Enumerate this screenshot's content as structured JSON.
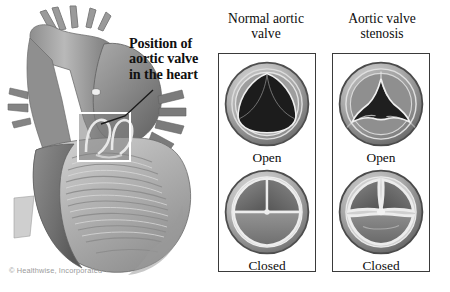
{
  "figure": {
    "background_color": "#ffffff",
    "callout": {
      "line1": "Position of",
      "line2": "aortic valve",
      "line3": "in the heart",
      "full_text": "Position of aortic valve in the heart"
    },
    "copyright": "© Healthwise, Incorporated"
  },
  "panels": {
    "normal": {
      "heading_line1": "Normal aortic",
      "heading_line2": "valve",
      "heading": "Normal aortic valve",
      "states": [
        {
          "label": "Open",
          "condition": "normal-open"
        },
        {
          "label": "Closed",
          "condition": "normal-closed"
        }
      ]
    },
    "stenosis": {
      "heading_line1": "Aortic valve",
      "heading_line2": "stenosis",
      "heading": "Aortic valve stenosis",
      "states": [
        {
          "label": "Open",
          "condition": "stenotic-open"
        },
        {
          "label": "Closed",
          "condition": "stenotic-closed"
        }
      ]
    }
  },
  "colors": {
    "panel_border": "#3a3a3a",
    "text": "#0d0d0d",
    "copyright_text": "#9a9a9a",
    "valve_ring_light": "#d8d8d8",
    "valve_ring_mid": "#9a9a9a",
    "valve_ring_dark": "#5a5a5a",
    "orifice_dark": "#1c1c1c",
    "cusp_gray": "#737373",
    "heart_muscle_light": "#c8c8c8",
    "heart_muscle_mid": "#9d9d9d",
    "heart_muscle_dark": "#6e6e6e",
    "highlight_box": "#ffffff"
  },
  "icons": {
    "leader_line": "callout-leader-line",
    "highlight_box": "valve-highlight-box"
  }
}
